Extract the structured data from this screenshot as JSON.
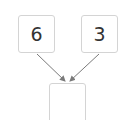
{
  "diagram": {
    "left_box": {
      "value": "6"
    },
    "right_box": {
      "value": "3"
    },
    "result_box": {
      "value": ""
    }
  },
  "colors": {
    "border": "#d4d4d4",
    "arrow": "#7a7a7a",
    "text": "#333333"
  }
}
